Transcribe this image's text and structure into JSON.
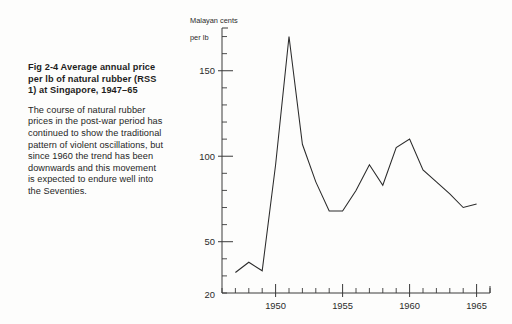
{
  "figure": {
    "caption_title": "Fig 2-4   Average annual price per lb of natural rubber (RSS 1) at Singapore, 1947–65",
    "caption_body": "The course of natural rubber prices in the post-war period has continued to show the traditional pattern of violent oscillations, but since 1960 the trend has been downwards and this movement is expected to endure well into the Seventies.",
    "line_color": "#2a2a2a",
    "axis_color": "#3a3a3a",
    "background_color": "#fdfdfc"
  },
  "chart_data": {
    "type": "line",
    "title": "Average annual price per lb of natural rubber (RSS 1) at Singapore, 1947–65",
    "xlabel": "",
    "ylabel": "Malayan cents per lb",
    "ylabel_line1": "Malayan cents",
    "ylabel_line2": "per lb",
    "x": [
      1947,
      1948,
      1949,
      1950,
      1951,
      1952,
      1953,
      1954,
      1955,
      1956,
      1957,
      1958,
      1959,
      1960,
      1961,
      1962,
      1963,
      1964,
      1965
    ],
    "values": [
      32,
      38,
      33,
      95,
      170,
      107,
      85,
      68,
      68,
      80,
      95,
      83,
      105,
      110,
      92,
      85,
      78,
      70,
      72
    ],
    "series": [
      {
        "name": "Average annual price (RSS 1), Singapore",
        "values": [
          32,
          38,
          33,
          95,
          170,
          107,
          85,
          68,
          68,
          80,
          95,
          83,
          105,
          110,
          92,
          85,
          78,
          70,
          72
        ]
      }
    ],
    "xlim": [
      1946,
      1966
    ],
    "ylim": [
      20,
      175
    ],
    "y_major_ticks": [
      50,
      100,
      150
    ],
    "y_major_tick_labels": [
      "50",
      "100",
      "150"
    ],
    "y_axis_min_label": "20",
    "y_minor_tick_step": 10,
    "x_major_ticks": [
      1950,
      1955,
      1960,
      1965
    ],
    "x_major_tick_labels": [
      "1950",
      "1955",
      "1960",
      "1965"
    ],
    "x_minor_tick_step": 1,
    "grid": false,
    "legend": false,
    "legend_position": "none"
  }
}
